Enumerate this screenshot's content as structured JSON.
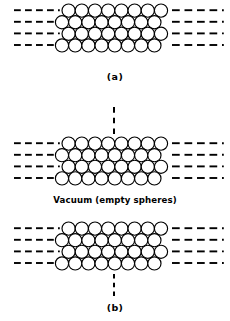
{
  "figure": {
    "width": 230,
    "height": 321,
    "background_color": "#ffffff",
    "line_color": "#000000"
  },
  "labels": {
    "panel_a": "(a)",
    "panel_b": "(b)",
    "vacuum_caption": "Vacuum (empty spheres)"
  },
  "panels": [
    {
      "id": "a",
      "label": "(a)",
      "label_y": 72,
      "lattice": {
        "x_left": 62,
        "y_top": 4,
        "rows": 4,
        "cols_even": 8,
        "cols_odd": 8,
        "radius": 6.6,
        "row_spacing": 11.6,
        "col_spacing": 13.2,
        "row_offset": 6.6,
        "fill": "#ffffff",
        "stroke": "#000000",
        "stroke_width": 1.15
      },
      "dash_rows_y": [
        10.2,
        21.8,
        33.4,
        45.0
      ],
      "dash_left": {
        "x_start": 14,
        "x_end": 58,
        "dashes": 4,
        "terminal_dot": true
      },
      "dash_right": {
        "x_start": 172,
        "x_end": 222,
        "dashes": 4,
        "terminal_dot": true
      },
      "vertical_dash": null
    },
    {
      "id": "b-upper",
      "label": "",
      "lattice": {
        "x_left": 62,
        "y_top": 137,
        "rows": 4,
        "cols_even": 8,
        "cols_odd": 8,
        "radius": 6.6,
        "row_spacing": 11.6,
        "col_spacing": 13.2,
        "row_offset": 6.6,
        "fill": "#ffffff",
        "stroke": "#000000",
        "stroke_width": 1.15
      },
      "dash_rows_y": [
        143.2,
        154.8,
        166.4,
        178.0
      ],
      "dash_left": {
        "x_start": 14,
        "x_end": 58,
        "dashes": 4,
        "terminal_dot": true
      },
      "dash_right": {
        "x_start": 172,
        "x_end": 222,
        "dashes": 4,
        "terminal_dot": true
      },
      "vertical_dash": {
        "x": 114,
        "y_start": 107,
        "y_end": 134,
        "dashes": 3
      }
    },
    {
      "id": "b-lower",
      "label": "(b)",
      "label_y": 303,
      "lattice": {
        "x_left": 62,
        "y_top": 222,
        "rows": 4,
        "cols_even": 8,
        "cols_odd": 8,
        "radius": 6.6,
        "row_spacing": 11.6,
        "col_spacing": 13.2,
        "row_offset": 6.6,
        "fill": "#ffffff",
        "stroke": "#000000",
        "stroke_width": 1.15
      },
      "dash_rows_y": [
        228.2,
        239.8,
        251.4,
        263.0
      ],
      "dash_left": {
        "x_start": 14,
        "x_end": 58,
        "dashes": 4,
        "terminal_dot": true
      },
      "dash_right": {
        "x_start": 172,
        "x_end": 222,
        "dashes": 4,
        "terminal_dot": true
      },
      "vertical_dash": {
        "x": 114,
        "y_start": 274,
        "y_end": 296,
        "dashes": 3
      }
    }
  ]
}
